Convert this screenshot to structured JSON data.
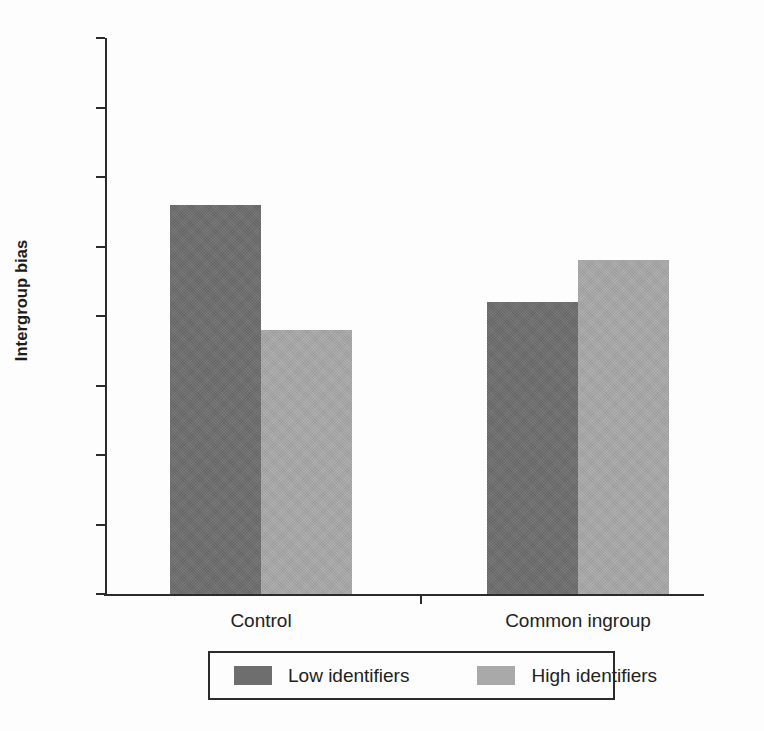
{
  "chart_data": {
    "type": "bar",
    "title": "",
    "xlabel": "",
    "ylabel": "Intergroup bias",
    "categories": [
      "Control",
      "Common ingroup"
    ],
    "series": [
      {
        "name": "Low identifiers",
        "color": "#6e6e6e",
        "values": [
          68,
          61
        ]
      },
      {
        "name": "High identifiers",
        "color": "#a9a9a9",
        "values": [
          59,
          64
        ]
      }
    ],
    "ylim": [
      40,
      80
    ],
    "yticks": [
      80,
      75,
      70,
      65,
      60,
      55,
      50,
      45,
      40
    ],
    "ytick_labels": [
      "80",
      "75",
      "70",
      "65",
      "60",
      "55",
      "50",
      "45",
      "40"
    ],
    "grid": false,
    "legend_position": "bottom-center",
    "bar_style": "grouped",
    "axis_color": "#2b2b2b"
  },
  "axis": {
    "y_label": "Intergroup bias",
    "ticks": [
      {
        "value": 80,
        "label": "80"
      },
      {
        "value": 75,
        "label": "75"
      },
      {
        "value": 70,
        "label": "70"
      },
      {
        "value": 65,
        "label": "65"
      },
      {
        "value": 60,
        "label": "60"
      },
      {
        "value": 55,
        "label": "55"
      },
      {
        "value": 50,
        "label": "50"
      },
      {
        "value": 45,
        "label": "45"
      },
      {
        "value": 40,
        "label": "40"
      }
    ]
  },
  "categories": [
    {
      "label": "Control"
    },
    {
      "label": "Common ingroup"
    }
  ],
  "legend": {
    "items": [
      {
        "label": "Low identifiers",
        "color": "#6e6e6e"
      },
      {
        "label": "High identifiers",
        "color": "#a9a9a9"
      }
    ]
  }
}
